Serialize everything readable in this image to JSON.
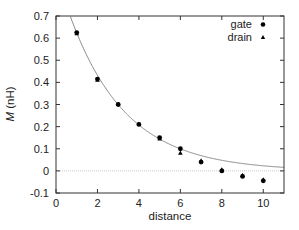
{
  "chart_data": {
    "type": "scatter",
    "title": "",
    "xlabel": "distance",
    "ylabel_italic": "M",
    "ylabel_rest": " (nH)",
    "xlim": [
      0,
      11
    ],
    "ylim": [
      -0.1,
      0.7
    ],
    "xticks": [
      0,
      2,
      4,
      6,
      8,
      10
    ],
    "xtick_labels": [
      "0",
      "2",
      "4",
      "6",
      "8",
      "10"
    ],
    "yticks": [
      -0.1,
      0,
      0.1,
      0.2,
      0.3,
      0.4,
      0.5,
      0.6,
      0.7
    ],
    "ytick_labels": [
      "-0.1",
      "0",
      "0.1",
      "0.2",
      "0.3",
      "0.4",
      "0.5",
      "0.6",
      "0.7"
    ],
    "grid": false,
    "zero_line": true,
    "legend": {
      "placement": "top-right",
      "entries": [
        {
          "label": "gate",
          "marker": "circle"
        },
        {
          "label": "drain",
          "marker": "triangle"
        }
      ]
    },
    "series": [
      {
        "name": "gate",
        "marker": "circle",
        "x": [
          1,
          2,
          3,
          4,
          5,
          6,
          7,
          8,
          9,
          10
        ],
        "y": [
          0.625,
          0.415,
          0.3,
          0.21,
          0.15,
          0.1,
          0.04,
          0.0,
          -0.025,
          -0.045
        ]
      },
      {
        "name": "drain",
        "marker": "triangle",
        "x": [
          1,
          2,
          3,
          4,
          5,
          6,
          7,
          8,
          9,
          10
        ],
        "y": [
          0.62,
          0.41,
          0.3,
          0.21,
          0.145,
          0.08,
          0.045,
          0.005,
          -0.02,
          -0.04
        ]
      }
    ],
    "fit_curve": {
      "name": "exponential fit",
      "formula": "M = a*exp(-b*x)",
      "a": 0.9,
      "b": 0.367,
      "color": "#888888"
    }
  }
}
